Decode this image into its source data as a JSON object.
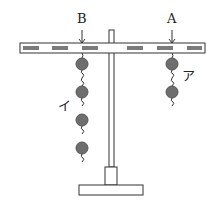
{
  "labels": {
    "point_b": "B",
    "point_a": "A",
    "weights_a": "ア",
    "weights_b": "イ"
  },
  "weights": {
    "at_b_count": 4,
    "at_a_count": 2
  },
  "colors": {
    "weight": "#6e6e6e",
    "bar_segment": "#7a7a7a",
    "outline": "#333333"
  }
}
